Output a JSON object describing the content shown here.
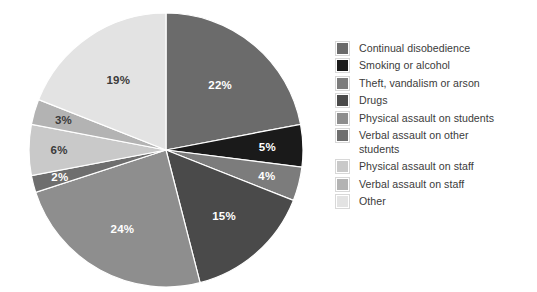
{
  "chart_data": {
    "type": "pie",
    "title": "",
    "subtitle": "",
    "xlabel": "",
    "ylabel": "",
    "legend_position": "right",
    "grid": false,
    "start_angle_deg": 0,
    "direction": "clockwise",
    "total_percent": 100,
    "categories": [
      "Continual disobedience",
      "Smoking or alcohol",
      "Theft, vandalism or arson",
      "Drugs",
      "Physical assault on students",
      "Verbal assault on other students",
      "Physical assault on staff",
      "Verbal assault on staff",
      "Other"
    ],
    "values": [
      22,
      5,
      4,
      15,
      24,
      2,
      6,
      3,
      19
    ],
    "labels": [
      "22%",
      "5%",
      "4%",
      "15%",
      "24%",
      "2%",
      "6%",
      "3%",
      "19%"
    ],
    "colors": [
      "#6b6b6b",
      "#1a1a1a",
      "#7c7c7c",
      "#4a4a4a",
      "#8e8e8e",
      "#6e6e6e",
      "#c9c9c9",
      "#b3b3b3",
      "#e3e3e3"
    ],
    "label_colors": [
      "#ffffff",
      "#ffffff",
      "#ffffff",
      "#ffffff",
      "#ffffff",
      "#ffffff",
      "#3b3b3b",
      "#3b3b3b",
      "#3b3b3b"
    ],
    "slices": [
      {
        "label": "22%",
        "value": 22,
        "category": "Continual disobedience",
        "color": "#6b6b6b",
        "label_color": "#ffffff",
        "label_radius": 0.62
      },
      {
        "label": "5%",
        "value": 5,
        "category": "Smoking or alcohol",
        "color": "#1a1a1a",
        "label_color": "#ffffff",
        "label_radius": 0.74
      },
      {
        "label": "4%",
        "value": 4,
        "category": "Theft, vandalism or arson",
        "color": "#7c7c7c",
        "label_color": "#ffffff",
        "label_radius": 0.76
      },
      {
        "label": "15%",
        "value": 15,
        "category": "Drugs",
        "color": "#4a4a4a",
        "label_color": "#ffffff",
        "label_radius": 0.64
      },
      {
        "label": "24%",
        "value": 24,
        "category": "Physical assault on students",
        "color": "#8e8e8e",
        "label_color": "#ffffff",
        "label_radius": 0.66
      },
      {
        "label": "2%",
        "value": 2,
        "category": "Verbal assault on other students",
        "color": "#6e6e6e",
        "label_color": "#ffffff",
        "label_radius": 0.8
      },
      {
        "label": "6%",
        "value": 6,
        "category": "Physical assault on staff",
        "color": "#c9c9c9",
        "label_color": "#3b3b3b",
        "label_radius": 0.78
      },
      {
        "label": "3%",
        "value": 3,
        "category": "Verbal assault on staff",
        "color": "#b3b3b3",
        "label_color": "#3b3b3b",
        "label_radius": 0.78
      },
      {
        "label": "19%",
        "value": 19,
        "category": "Other",
        "color": "#e3e3e3",
        "label_color": "#3b3b3b",
        "label_radius": 0.62
      }
    ]
  },
  "legend": {
    "items": [
      {
        "label": "Continual disobedience",
        "color": "#6b6b6b"
      },
      {
        "label": "Smoking or alcohol",
        "color": "#1a1a1a"
      },
      {
        "label": "Theft, vandalism or arson",
        "color": "#7c7c7c"
      },
      {
        "label": "Drugs",
        "color": "#4a4a4a"
      },
      {
        "label": "Physical assault on students",
        "color": "#8e8e8e"
      },
      {
        "label": "Verbal assault on other\nstudents",
        "color": "#6e6e6e"
      },
      {
        "label": "Physical assault on staff",
        "color": "#c9c9c9"
      },
      {
        "label": "Verbal assault on staff",
        "color": "#b3b3b3"
      },
      {
        "label": "Other",
        "color": "#e3e3e3"
      }
    ]
  },
  "geometry": {
    "center_x": 139,
    "center_y": 139,
    "radius": 137
  }
}
